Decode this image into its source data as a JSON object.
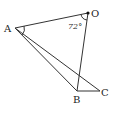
{
  "diagram": {
    "type": "geometry",
    "points": {
      "O": {
        "label": "O",
        "x": 88,
        "y": 13
      },
      "A": {
        "label": "A",
        "x": 15,
        "y": 28
      },
      "B": {
        "label": "B",
        "x": 77,
        "y": 91
      },
      "C": {
        "label": "C",
        "x": 100,
        "y": 91
      }
    },
    "segments": [
      "AO",
      "OB",
      "AB",
      "AC",
      "BC"
    ],
    "angle_label": "72°",
    "angle_at": "O",
    "line_color": "#333333"
  }
}
